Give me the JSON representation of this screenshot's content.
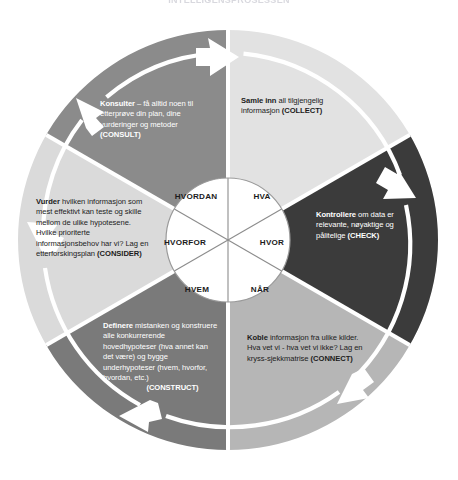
{
  "page": {
    "title": "INTELLIGENSPROSESSEN",
    "background": "#ffffff"
  },
  "diagram": {
    "name": "intelligence-cycle-wheel",
    "type": "circular-process",
    "center": {
      "x": 228,
      "y": 240
    },
    "outer_radius": 210,
    "inner_radius": 62,
    "rotation_direction": "clockwise",
    "hub": {
      "segments": [
        {
          "id": "hva",
          "label": "HVA",
          "angle_deg": 300,
          "x": 262,
          "y": 196
        },
        {
          "id": "hvor",
          "label": "HVOR",
          "angle_deg": 0,
          "x": 272,
          "y": 242
        },
        {
          "id": "naar",
          "label": "NÅR",
          "angle_deg": 60,
          "x": 260,
          "y": 289
        },
        {
          "id": "hvem",
          "label": "HVEM",
          "angle_deg": 120,
          "x": 197,
          "y": 289
        },
        {
          "id": "hvorfor",
          "label": "HVORFOR",
          "angle_deg": 180,
          "x": 185,
          "y": 242
        },
        {
          "id": "hvordan",
          "label": "HVORDAN",
          "angle_deg": 240,
          "x": 196,
          "y": 196
        }
      ]
    },
    "segments": [
      {
        "id": "collect",
        "code": "(COLLECT)",
        "lead": "Samle inn",
        "body": " all tilgjengelig informasjon",
        "fill": "#e2e2e2",
        "text_color": "#1c1c1c",
        "start_deg": -90,
        "end_deg": -30
      },
      {
        "id": "check",
        "code": "(CHECK)",
        "lead": "Kontrollere",
        "body": " om data er relevante, nøyaktige og pålitelige",
        "fill": "#3b3b3b",
        "text_color": "#ffffff",
        "start_deg": -30,
        "end_deg": 30
      },
      {
        "id": "connect",
        "code": "(CONNECT)",
        "lead": "Koble",
        "body": " informasjon fra ulike kilder. Hva vet vi - hva vet vi ikke? Lag en kryss-sjekkmatrise",
        "fill": "#b6b6b6",
        "text_color": "#1c1c1c",
        "start_deg": 30,
        "end_deg": 90
      },
      {
        "id": "construct",
        "code": "(CONSTRUCT)",
        "lead": "Definere",
        "body": " mistanken og konstruere alle konkurrerende hovedhypoteser (hva annet kan det være) og bygge underhypoteser (hvem, hvorfor, hvordan, etc.)",
        "fill": "#7a7a7a",
        "text_color": "#ffffff",
        "start_deg": 90,
        "end_deg": 150
      },
      {
        "id": "consider",
        "code": "(CONSIDER)",
        "lead": "Vurder",
        "body": " hvilken informasjon som mest effektivt kan teste og skille mellom de ulike hypotesene. Hvilke prioriterte informasjonsbehov har vi? Lag en etterforskingsplan",
        "fill": "#dadada",
        "text_color": "#1c1c1c",
        "start_deg": 150,
        "end_deg": 210
      },
      {
        "id": "consult",
        "code": "(CONSULT)",
        "lead": "Konsulter",
        "body": " – få alltid noen til etterprøve din plan, dine vurderinger og metoder",
        "fill": "#8b8b8b",
        "text_color": "#ffffff",
        "start_deg": 210,
        "end_deg": 270
      }
    ],
    "arrows": {
      "color": "#ffffff",
      "count": 6,
      "note": "white chevron arrows riding the ring between segments, pointing clockwise"
    }
  }
}
